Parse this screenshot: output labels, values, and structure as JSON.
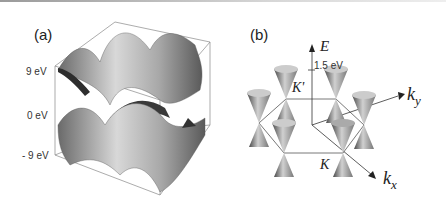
{
  "panel_a": {
    "label": "(a)",
    "ticks": [
      "9 eV",
      "0 eV",
      "- 9 eV"
    ],
    "description": "3D band structure surfaces inside a bounding box"
  },
  "panel_b": {
    "label": "(b)",
    "energy_axis": "E",
    "energy_scale": "1.5 eV",
    "point_k_prime": "K'",
    "point_k": "K",
    "axis_ky": "k",
    "axis_ky_sub": "y",
    "axis_kx": "k",
    "axis_kx_sub": "x",
    "description": "Dirac cones at hexagonal Brillouin zone corners"
  }
}
